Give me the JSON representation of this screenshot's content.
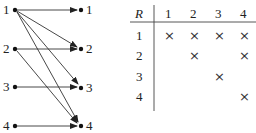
{
  "graph": {
    "left_nodes": [
      "1",
      "2",
      "3",
      "4"
    ],
    "right_nodes": [
      "1",
      "2",
      "3",
      "4"
    ],
    "edges": [
      {
        "from": "1",
        "to": "1"
      },
      {
        "from": "1",
        "to": "2"
      },
      {
        "from": "1",
        "to": "3"
      },
      {
        "from": "1",
        "to": "4"
      },
      {
        "from": "2",
        "to": "2"
      },
      {
        "from": "2",
        "to": "4"
      },
      {
        "from": "3",
        "to": "3"
      },
      {
        "from": "4",
        "to": "4"
      }
    ]
  },
  "table": {
    "corner": "R",
    "columns": [
      "1",
      "2",
      "3",
      "4"
    ],
    "rows": [
      {
        "label": "1",
        "cells": [
          "×",
          "×",
          "×",
          "×"
        ]
      },
      {
        "label": "2",
        "cells": [
          "",
          "×",
          "",
          "×"
        ]
      },
      {
        "label": "3",
        "cells": [
          "",
          "",
          "×",
          ""
        ]
      },
      {
        "label": "4",
        "cells": [
          "",
          "",
          "",
          "×"
        ]
      }
    ]
  }
}
